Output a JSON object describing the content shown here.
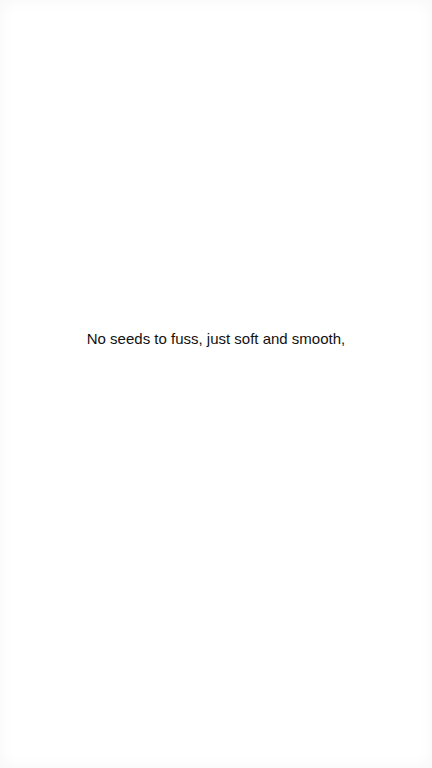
{
  "caption": {
    "text": "No seeds to fuss, just soft and smooth,",
    "color": "#111111"
  },
  "background": {
    "color": "#ffffff"
  }
}
